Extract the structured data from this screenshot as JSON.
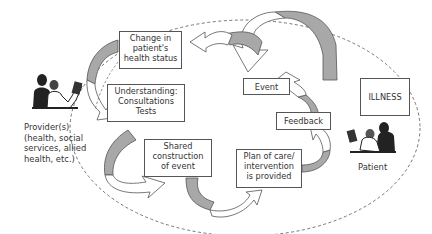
{
  "diagram": {
    "type": "cycle",
    "boxes": {
      "change": "Change in\npatient's\nhealth status",
      "understanding": "Understanding:\nConsultations\nTests",
      "shared": "Shared\nconstruction\nof event",
      "plan": "Plan of care/\nintervention\nis provided",
      "feedback": "Feedback",
      "event": "Event",
      "illness": "ILLNESS"
    },
    "actors": {
      "provider": "Provider(s)\n(health, social\nservices, allied\nhealth, etc.)",
      "patient": "Patient"
    },
    "colors": {
      "arrow_shade": "#a8a8a8",
      "line": "#555555",
      "dashed": "#666666"
    }
  }
}
